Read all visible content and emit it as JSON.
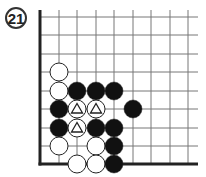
{
  "diagram": {
    "label": "21",
    "board": {
      "columns": [
        40,
        59,
        77,
        96,
        114,
        133,
        151,
        170,
        188
      ],
      "rows": [
        17,
        35,
        54,
        72,
        91,
        109,
        128,
        146,
        164
      ],
      "edges": [
        "left",
        "bottom"
      ],
      "line_color": "#777777",
      "edge_color": "#222222"
    },
    "stones": [
      {
        "col": 1,
        "row": 3,
        "color": "white"
      },
      {
        "col": 1,
        "row": 4,
        "color": "white"
      },
      {
        "col": 2,
        "row": 4,
        "color": "black"
      },
      {
        "col": 3,
        "row": 4,
        "color": "black"
      },
      {
        "col": 4,
        "row": 4,
        "color": "black"
      },
      {
        "col": 1,
        "row": 5,
        "color": "black"
      },
      {
        "col": 2,
        "row": 5,
        "color": "white",
        "mark": "triangle"
      },
      {
        "col": 3,
        "row": 5,
        "color": "white",
        "mark": "triangle"
      },
      {
        "col": 5,
        "row": 5,
        "color": "black"
      },
      {
        "col": 1,
        "row": 6,
        "color": "black"
      },
      {
        "col": 2,
        "row": 6,
        "color": "white",
        "mark": "triangle"
      },
      {
        "col": 3,
        "row": 6,
        "color": "black"
      },
      {
        "col": 4,
        "row": 6,
        "color": "black"
      },
      {
        "col": 1,
        "row": 7,
        "color": "white"
      },
      {
        "col": 3,
        "row": 7,
        "color": "white"
      },
      {
        "col": 4,
        "row": 7,
        "color": "black"
      },
      {
        "col": 2,
        "row": 8,
        "color": "white"
      },
      {
        "col": 3,
        "row": 8,
        "color": "white"
      },
      {
        "col": 4,
        "row": 8,
        "color": "black"
      }
    ]
  }
}
